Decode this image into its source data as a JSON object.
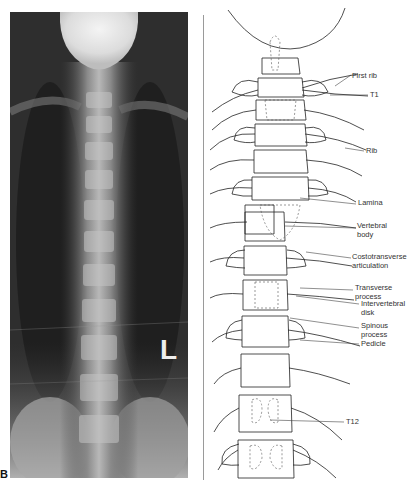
{
  "figure": {
    "panel_letter": "B",
    "xray_marker": "L",
    "labels": [
      {
        "id": "first-rib",
        "text": "First rib",
        "x": 352,
        "y": 72
      },
      {
        "id": "t1",
        "text": "T1",
        "x": 370,
        "y": 93
      },
      {
        "id": "rib",
        "text": "Rib",
        "x": 366,
        "y": 149
      },
      {
        "id": "lamina",
        "text": "Lamina",
        "x": 358,
        "y": 201
      },
      {
        "id": "vertebral-body",
        "text": "Vertebral\nbody",
        "x": 357,
        "y": 224
      },
      {
        "id": "costotransverse-articulation",
        "text": "Costotransverse\narticulation",
        "x": 352,
        "y": 255
      },
      {
        "id": "transverse-process",
        "text": "Transverse\nprocess",
        "x": 355,
        "y": 286
      },
      {
        "id": "intervertebral-disk",
        "text": "Intervertebral\ndisk",
        "x": 361,
        "y": 300
      },
      {
        "id": "spinous-process",
        "text": "Spinous\nprocess",
        "x": 361,
        "y": 323
      },
      {
        "id": "pedicle",
        "text": "Pedicle",
        "x": 361,
        "y": 341
      },
      {
        "id": "t12",
        "text": "T12",
        "x": 346,
        "y": 419
      }
    ]
  }
}
